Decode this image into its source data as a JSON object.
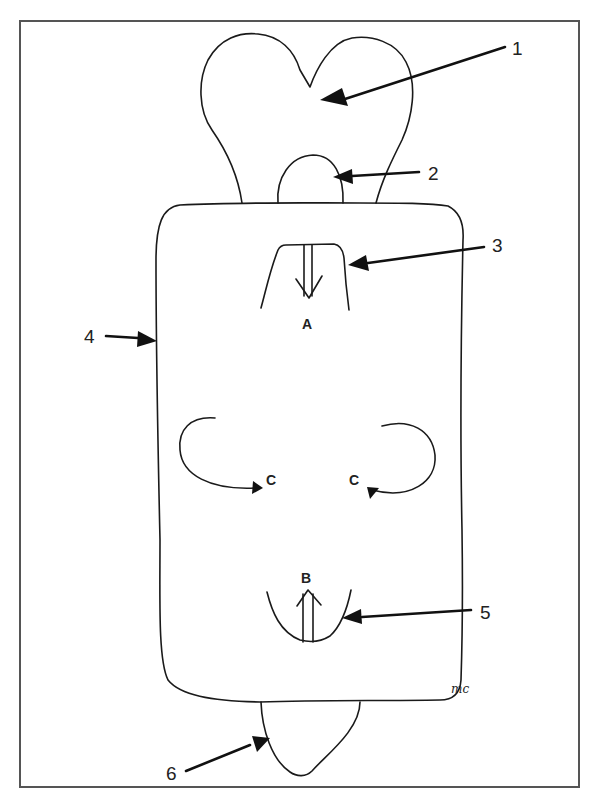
{
  "diagram": {
    "type": "schematic line drawing",
    "frame": {
      "border_color": "#555555"
    },
    "callouts": [
      {
        "id": "1",
        "label": "1",
        "target": "heart-shaped upper lobe"
      },
      {
        "id": "2",
        "label": "2",
        "target": "small dome inside upper stem"
      },
      {
        "id": "3",
        "label": "3",
        "target": "upper trapezoid cavity with downward arrow"
      },
      {
        "id": "4",
        "label": "4",
        "target": "left edge of central rectangular body"
      },
      {
        "id": "5",
        "label": "5",
        "target": "lower U-shaped cavity with upward arrow"
      },
      {
        "id": "6",
        "label": "6",
        "target": "lower rounded lobe"
      }
    ],
    "letters": {
      "a": "A",
      "b": "B",
      "c_left": "C",
      "c_right": "C"
    },
    "signature": "mc"
  }
}
